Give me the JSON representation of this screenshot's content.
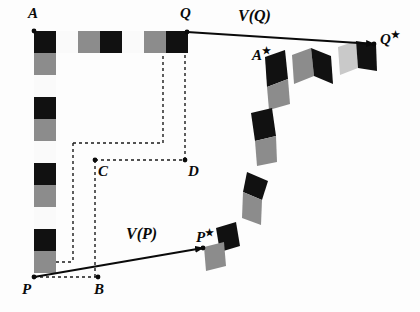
{
  "figure": {
    "background": "#fdfdfd",
    "width": 420,
    "height": 312
  },
  "colors": {
    "black": "#111111",
    "gray": "#8c8c8c",
    "light_gray": "#c9c9c9",
    "white": "#fafafa",
    "line": "#0a0a0a",
    "dash": "#1a1a1a"
  },
  "labels": [
    {
      "name": "label-A",
      "text": "A",
      "star": false,
      "x": 28,
      "y": 6,
      "kind": "pt"
    },
    {
      "name": "label-Q",
      "text": "Q",
      "star": false,
      "x": 180,
      "y": 6,
      "kind": "pt"
    },
    {
      "name": "label-Q-star",
      "text": "Q",
      "star": true,
      "x": 380,
      "y": 30,
      "kind": "pt"
    },
    {
      "name": "label-A-star",
      "text": "A",
      "star": true,
      "x": 252,
      "y": 46,
      "kind": "pt"
    },
    {
      "name": "label-C",
      "text": "C",
      "star": false,
      "x": 98,
      "y": 164,
      "kind": "pt"
    },
    {
      "name": "label-D",
      "text": "D",
      "star": false,
      "x": 188,
      "y": 164,
      "kind": "pt"
    },
    {
      "name": "label-P",
      "text": "P",
      "star": false,
      "x": 22,
      "y": 282,
      "kind": "pt"
    },
    {
      "name": "label-B",
      "text": "B",
      "star": false,
      "x": 94,
      "y": 282,
      "kind": "pt"
    },
    {
      "name": "label-P-star",
      "text": "P",
      "star": true,
      "x": 196,
      "y": 228,
      "kind": "pt"
    },
    {
      "name": "label-vector-VQ",
      "text": "V(Q)",
      "star": false,
      "x": 238,
      "y": 8,
      "kind": "vec"
    },
    {
      "name": "label-vector-VP",
      "text": "V(P)",
      "star": false,
      "x": 126,
      "y": 226,
      "kind": "vec"
    }
  ],
  "vectors": [
    {
      "name": "vector-arrow-VQ",
      "label": "V(Q)",
      "x1": 187,
      "y1": 32,
      "x2": 374,
      "y2": 44
    },
    {
      "name": "vector-arrow-VP",
      "label": "V(P)",
      "x1": 34,
      "y1": 277,
      "x2": 203,
      "y2": 248
    }
  ],
  "points": [
    {
      "name": "point-A",
      "x": 34,
      "y": 31
    },
    {
      "name": "point-Q",
      "x": 187,
      "y": 32
    },
    {
      "name": "point-C",
      "x": 95,
      "y": 160
    },
    {
      "name": "point-D",
      "x": 185,
      "y": 160
    },
    {
      "name": "point-P",
      "x": 34,
      "y": 277
    },
    {
      "name": "point-B",
      "x": 98,
      "y": 277
    },
    {
      "name": "point-P-star",
      "x": 203,
      "y": 248
    },
    {
      "name": "point-Q-star",
      "x": 374,
      "y": 44
    }
  ],
  "strip_vertical": {
    "name": "checker-strip-vertical",
    "x": 34,
    "y": 31,
    "cell": 22,
    "count": 11,
    "pattern": [
      "black",
      "gray",
      "white",
      "black",
      "gray",
      "white",
      "black",
      "gray",
      "white",
      "black",
      "gray"
    ]
  },
  "strip_horizontal": {
    "name": "checker-strip-horizontal",
    "x": 34,
    "y": 31,
    "cell": 22,
    "count": 7,
    "pattern": [
      "black",
      "white",
      "gray",
      "black",
      "white",
      "gray",
      "black"
    ]
  },
  "dashed_paths": [
    {
      "name": "dash-C-to-D",
      "points": "95,160 185,160"
    },
    {
      "name": "dash-D-up-to-Q",
      "points": "185,160 185,53"
    },
    {
      "name": "dash-inner-vertical",
      "points": "163,143 163,53"
    },
    {
      "name": "dash-inner-horiz",
      "points": "73,143 163,143"
    },
    {
      "name": "dash-left-vertical",
      "points": "73,143 73,262"
    },
    {
      "name": "dash-left-bottom",
      "points": "56,262 73,262"
    },
    {
      "name": "dash-C-vertical",
      "points": "95,160 95,277"
    },
    {
      "name": "dash-P-to-B",
      "points": "34,277 98,277"
    }
  ],
  "deformed_chain": {
    "name": "deformed-checker-chain",
    "description": "Chain of sheared quadrilateral cells curving from Q* down and around to P*",
    "cells": [
      {
        "face": "#8c8c8c",
        "pts": "292,55 311,48 314,76 294,84"
      },
      {
        "face": "#111111",
        "pts": "311,48 331,56 333,84 314,76"
      },
      {
        "face": "#c9c9c9",
        "pts": "338,47 356,41 358,68 340,75"
      },
      {
        "face": "#111111",
        "pts": "356,41 376,44 377,71 358,68"
      },
      {
        "face": "#111111",
        "pts": "265,57 285,50 288,79 267,87"
      },
      {
        "face": "#8c8c8c",
        "pts": "267,87 288,79 290,104 269,110"
      },
      {
        "face": "#111111",
        "pts": "251,113 272,108 276,136 255,141"
      },
      {
        "face": "#8c8c8c",
        "pts": "255,141 276,136 277,162 257,166"
      },
      {
        "face": "#111111",
        "pts": "247,172 268,181 262,200 243,192"
      },
      {
        "face": "#8c8c8c",
        "pts": "243,192 262,200 261,225 242,218"
      },
      {
        "face": "#111111",
        "pts": "216,228 236,222 240,246 220,252"
      },
      {
        "face": "#8c8c8c",
        "pts": "204,247 224,242 226,266 206,271"
      }
    ]
  }
}
